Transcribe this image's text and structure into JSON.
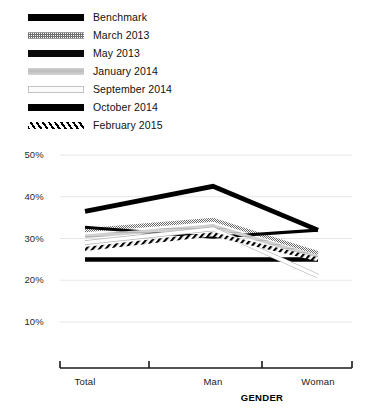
{
  "chart_data": {
    "type": "line",
    "title": "",
    "xlabel": "GENDER",
    "ylabel": "",
    "categories": [
      "Total",
      "Man",
      "Woman"
    ],
    "ylim": [
      5,
      52
    ],
    "yticks": [
      10,
      20,
      30,
      40,
      50
    ],
    "ytick_labels": [
      "10%",
      "20%",
      "30%",
      "40%",
      "50%"
    ],
    "grid": true,
    "legend_position": "top-left",
    "series": [
      {
        "name": "Benchmark",
        "values": [
          25.0,
          25.0,
          25.0
        ],
        "pattern": "solid-black",
        "color": "#000000",
        "width": 4.5
      },
      {
        "name": "March 2013",
        "values": [
          32.0,
          34.5,
          26.5
        ],
        "pattern": "checker-gray",
        "color": "#6f6f6f",
        "width": 4.0
      },
      {
        "name": "May 2013",
        "values": [
          32.7,
          30.3,
          32.0
        ],
        "pattern": "solid-black",
        "color": "#0a0a0a",
        "width": 3.2
      },
      {
        "name": "January 2014",
        "values": [
          30.5,
          33.0,
          25.5
        ],
        "pattern": "light-gray",
        "color": "#c8c8c8",
        "width": 3.6
      },
      {
        "name": "September 2014",
        "values": [
          29.0,
          32.3,
          21.0
        ],
        "pattern": "hollow",
        "color": "#fbfbfb",
        "width": 3.4
      },
      {
        "name": "October 2014",
        "values": [
          36.5,
          42.5,
          32.0
        ],
        "pattern": "solid-black",
        "color": "#000000",
        "width": 4.8
      },
      {
        "name": "February 2015",
        "values": [
          27.5,
          31.0,
          25.0
        ],
        "pattern": "diag-hatch",
        "color": "#000000",
        "width": 4.0
      }
    ]
  },
  "legend": {
    "items": [
      {
        "label": "Benchmark"
      },
      {
        "label": "March 2013"
      },
      {
        "label": "May 2013"
      },
      {
        "label": "January 2014"
      },
      {
        "label": "September 2014"
      },
      {
        "label": "October 2014"
      },
      {
        "label": "February 2015"
      }
    ]
  }
}
